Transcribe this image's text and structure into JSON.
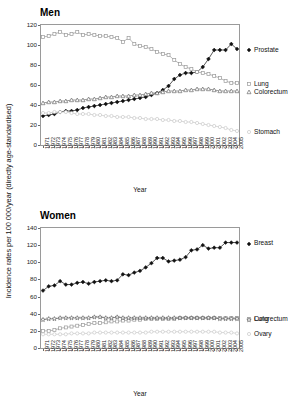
{
  "figure": {
    "ylabel": "Incidence rates per 100 000/year (directly age-standardised)"
  },
  "chart_data": [
    {
      "type": "line",
      "title": "Men",
      "xlabel": "Year",
      "ylabel": "Incidence rates per 100 000/year (directly age-standardised)",
      "grid": false,
      "legend_position": "right",
      "ylim": [
        0,
        120
      ],
      "yticks": [
        0,
        20,
        40,
        60,
        80,
        100,
        120
      ],
      "x": [
        1971,
        1972,
        1973,
        1974,
        1975,
        1976,
        1977,
        1978,
        1979,
        1980,
        1981,
        1982,
        1983,
        1984,
        1985,
        1986,
        1987,
        1988,
        1989,
        1990,
        1991,
        1992,
        1993,
        1994,
        1995,
        1996,
        1997,
        1998,
        1999,
        2000,
        2001,
        2002,
        2003,
        2004,
        2005
      ],
      "categories": [
        "1971",
        "1972",
        "1973",
        "1974",
        "1975",
        "1976",
        "1977",
        "1978",
        "1979",
        "1980",
        "1981",
        "1982",
        "1983",
        "1984",
        "1985",
        "1986",
        "1987",
        "1988",
        "1989",
        "1990",
        "1991",
        "1992",
        "1993",
        "1994",
        "1995",
        "1996",
        "1997",
        "1998",
        "1999",
        "2000",
        "2001",
        "2002",
        "2003",
        "2004",
        "2005"
      ],
      "series": [
        {
          "name": "Prostate",
          "marker": "filled-diamond",
          "color": "#111111",
          "values": [
            29,
            30,
            31,
            33,
            34,
            34,
            35,
            37,
            38,
            39,
            40,
            41,
            42,
            43,
            44,
            45,
            46,
            47,
            48,
            50,
            52,
            55,
            59,
            66,
            70,
            72,
            72,
            73,
            78,
            86,
            95,
            95,
            95,
            101,
            96
          ]
        },
        {
          "name": "Lung",
          "marker": "open-square",
          "color": "#9a9a9a",
          "values": [
            108,
            109,
            111,
            113,
            110,
            111,
            113,
            110,
            111,
            110,
            109,
            109,
            108,
            107,
            103,
            107,
            101,
            99,
            98,
            96,
            93,
            91,
            90,
            85,
            81,
            78,
            76,
            73,
            72,
            71,
            69,
            67,
            64,
            62,
            62
          ]
        },
        {
          "name": "Colorectum",
          "marker": "open-triangle",
          "color": "#6f6f6f",
          "values": [
            42,
            43,
            43,
            44,
            44,
            45,
            45,
            45,
            46,
            46,
            47,
            48,
            48,
            49,
            49,
            49,
            50,
            50,
            51,
            52,
            52,
            53,
            54,
            54,
            54,
            55,
            55,
            56,
            56,
            56,
            55,
            54,
            54,
            54,
            54
          ]
        },
        {
          "name": "Stomach",
          "marker": "open-circle",
          "color": "#c9c9c9",
          "values": [
            32,
            32,
            33,
            33,
            33,
            32,
            31,
            31,
            31,
            30,
            30,
            29,
            29,
            28,
            28,
            28,
            27,
            27,
            26,
            26,
            26,
            25,
            25,
            24,
            24,
            23,
            23,
            22,
            21,
            20,
            19,
            18,
            17,
            15,
            14
          ]
        }
      ]
    },
    {
      "type": "line",
      "title": "Women",
      "xlabel": "Year",
      "ylabel": "Incidence rates per 100 000/year (directly age-standardised)",
      "grid": false,
      "legend_position": "right",
      "ylim": [
        0,
        140
      ],
      "yticks": [
        0,
        20,
        40,
        60,
        80,
        100,
        120,
        140
      ],
      "x": [
        1971,
        1972,
        1973,
        1974,
        1975,
        1976,
        1977,
        1978,
        1979,
        1980,
        1981,
        1982,
        1983,
        1984,
        1985,
        1986,
        1987,
        1988,
        1989,
        1990,
        1991,
        1992,
        1993,
        1994,
        1995,
        1996,
        1997,
        1998,
        1999,
        2000,
        2001,
        2002,
        2003,
        2004,
        2005
      ],
      "categories": [
        "1971",
        "1972",
        "1973",
        "1974",
        "1975",
        "1976",
        "1977",
        "1978",
        "1979",
        "1980",
        "1981",
        "1982",
        "1983",
        "1984",
        "1985",
        "1986",
        "1987",
        "1988",
        "1989",
        "1990",
        "1991",
        "1992",
        "1993",
        "1994",
        "1995",
        "1996",
        "1997",
        "1998",
        "1999",
        "2000",
        "2001",
        "2002",
        "2003",
        "2004",
        "2005"
      ],
      "series": [
        {
          "name": "Breast",
          "marker": "filled-diamond",
          "color": "#111111",
          "values": [
            67,
            72,
            73,
            78,
            74,
            74,
            76,
            77,
            75,
            77,
            78,
            79,
            78,
            79,
            86,
            85,
            88,
            90,
            94,
            99,
            105,
            105,
            101,
            102,
            103,
            106,
            114,
            115,
            120,
            116,
            117,
            117,
            123,
            123,
            123
          ]
        },
        {
          "name": "Lung",
          "marker": "open-square",
          "color": "#9a9a9a",
          "values": [
            20,
            20,
            21,
            23,
            24,
            25,
            26,
            27,
            28,
            29,
            29,
            30,
            31,
            31,
            32,
            32,
            33,
            33,
            34,
            34,
            34,
            34,
            34,
            34,
            35,
            35,
            35,
            35,
            35,
            35,
            35,
            35,
            35,
            35,
            35
          ]
        },
        {
          "name": "Colorectum",
          "marker": "open-star",
          "color": "#555555",
          "values": [
            33,
            34,
            34,
            35,
            35,
            35,
            35,
            35,
            35,
            36,
            36,
            35,
            35,
            36,
            35,
            35,
            35,
            35,
            35,
            35,
            35,
            35,
            35,
            35,
            35,
            35,
            35,
            35,
            35,
            35,
            35,
            34,
            34,
            34,
            34
          ]
        },
        {
          "name": "Ovary",
          "marker": "open-circle",
          "color": "#c9c9c9",
          "values": [
            16,
            16,
            16,
            16,
            16,
            17,
            17,
            17,
            17,
            18,
            18,
            18,
            18,
            18,
            18,
            18,
            18,
            18,
            18,
            19,
            19,
            19,
            19,
            19,
            19,
            19,
            19,
            19,
            19,
            19,
            19,
            18,
            18,
            18,
            17
          ]
        }
      ]
    }
  ]
}
